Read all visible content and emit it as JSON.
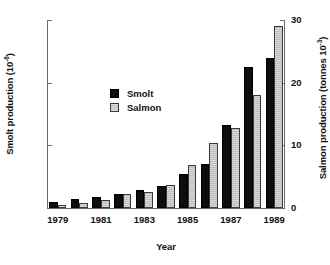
{
  "chart_data": {
    "type": "bar",
    "title": "",
    "xlabel": "Year",
    "ylabel": "Smolt production (10",
    "ylabel_sup": "-6",
    "ylabel_close": ")",
    "ylabel_right": "Salmon production (tonnes 10",
    "ylabel_right_sup": "-3",
    "ylabel_right_close": ")",
    "ylim": [
      0,
      30
    ],
    "ylim_right": [
      0,
      30
    ],
    "yticks": [
      0,
      10,
      20,
      30
    ],
    "yticks_right": [
      0,
      10,
      20,
      30
    ],
    "ytick_labels": [
      "0",
      "10",
      "20",
      "30"
    ],
    "ytick_labels_right": [
      "0",
      "10",
      "20",
      "30"
    ],
    "grid": false,
    "legend_position": "upper-center-left",
    "categories": [
      "1979",
      "1980",
      "1981",
      "1982",
      "1983",
      "1984",
      "1985",
      "1986",
      "1987",
      "1988",
      "1989"
    ],
    "xtick_labels": [
      "1979",
      "1981",
      "1983",
      "1985",
      "1987",
      "1989"
    ],
    "xtick_categories": [
      "1979",
      "1981",
      "1983",
      "1985",
      "1987",
      "1989"
    ],
    "series": [
      {
        "name": "Smolt",
        "color": "#0d0d0d",
        "values": [
          1.0,
          1.5,
          1.7,
          2.2,
          2.8,
          3.5,
          5.5,
          7.0,
          13.3,
          22.5,
          24.0
        ]
      },
      {
        "name": "Salmon",
        "color": "#cccccc",
        "values": [
          0.5,
          0.8,
          1.3,
          2.2,
          2.5,
          3.7,
          6.9,
          10.4,
          12.8,
          18.0,
          29.0
        ]
      }
    ]
  },
  "legend": {
    "items": [
      {
        "label": "Smolt"
      },
      {
        "label": "Salmon"
      }
    ]
  }
}
